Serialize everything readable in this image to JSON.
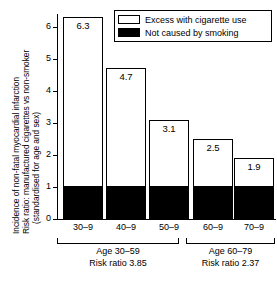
{
  "chart_data": {
    "type": "bar",
    "title": "",
    "subtitle": "",
    "xlabel": "",
    "ylabel_lines": [
      "Incidence of non-fatal myocardial infarction",
      "Risk ratio: manufactured cigarettes vs non-smoker",
      "(standardised  for age and sex)"
    ],
    "categories": [
      "30–9",
      "40–9",
      "50–9",
      "60–9",
      "70–9"
    ],
    "series": [
      {
        "name": "Not caused by smoking",
        "values": [
          1.0,
          1.0,
          1.0,
          1.0,
          1.0
        ]
      },
      {
        "name": "Excess with cigarette use",
        "values": [
          5.3,
          3.7,
          2.1,
          1.5,
          0.9
        ]
      }
    ],
    "totals": [
      6.3,
      4.7,
      3.1,
      2.5,
      1.9
    ],
    "data_labels": [
      "6.3",
      "4.7",
      "3.1",
      "2.5",
      "1.9"
    ],
    "stacked": true,
    "ylim": [
      0,
      6.4
    ],
    "yticks": [
      0,
      1,
      2,
      3,
      4,
      5,
      6
    ],
    "ytick_labels": [
      "0",
      "1",
      "2",
      "3",
      "4",
      "5",
      "6"
    ],
    "grid": false,
    "legend_position": "top-right",
    "colors": {
      "excess": "#ffffff",
      "base": "#000000",
      "axis": "#000000",
      "background": "#ffffff"
    }
  },
  "legend": {
    "items": [
      {
        "label": "Excess with cigarette use",
        "swatch": "excess"
      },
      {
        "label": "Not caused by smoking",
        "swatch": "base"
      }
    ]
  },
  "groups": [
    {
      "age_label": "Age 30–59",
      "risk_label": "Risk ratio 3.85",
      "categories": [
        "30–9",
        "40–9",
        "50–9"
      ]
    },
    {
      "age_label": "Age 60–79",
      "risk_label": "Risk ratio  2.37",
      "categories": [
        "60–9",
        "70–9"
      ]
    }
  ]
}
